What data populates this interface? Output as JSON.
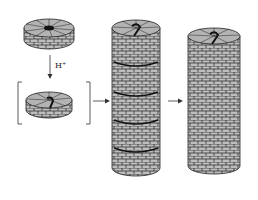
{
  "diagram": {
    "type": "process",
    "steps": [
      {
        "id": "monomer-disk",
        "label": ""
      },
      {
        "id": "protonated-disk",
        "label": "",
        "bracketed": true
      },
      {
        "id": "stacked-column",
        "label": ""
      },
      {
        "id": "fused-tube",
        "label": ""
      }
    ],
    "arrows": [
      {
        "from": "monomer-disk",
        "to": "protonated-disk",
        "label": "H⁺"
      },
      {
        "from": "protonated-disk",
        "to": "stacked-column",
        "label": ""
      },
      {
        "from": "stacked-column",
        "to": "fused-tube",
        "label": ""
      }
    ]
  },
  "colors": {
    "fill": "#b8b8b8",
    "stroke": "#222222",
    "dark": "#111111"
  }
}
